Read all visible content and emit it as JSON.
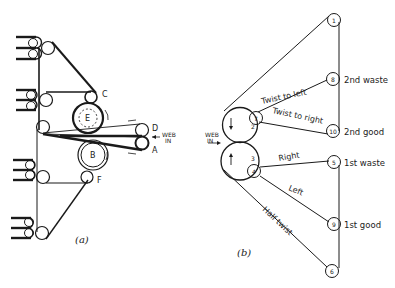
{
  "figure": {
    "panel_a": {
      "caption": "(a)",
      "roller_labels": [
        "C",
        "E",
        "D",
        "B",
        "A",
        "F"
      ],
      "web_in_label": [
        "WEB",
        "IN"
      ]
    },
    "panel_b": {
      "caption": "(b)",
      "web_in_label": [
        "WEB",
        "IN"
      ],
      "nodes": [
        "1",
        "2",
        "3",
        "4",
        "5",
        "6",
        "7",
        "8",
        "9",
        "10"
      ],
      "path_labels": {
        "twist_left": "Twist to left",
        "twist_right": "Twist to right",
        "right": "Right",
        "left": "Left",
        "half_twist": "Half twist"
      },
      "outputs": {
        "n8": "2nd waste",
        "n10": "2nd good",
        "n5": "1st waste",
        "n9": "1st good"
      }
    }
  }
}
